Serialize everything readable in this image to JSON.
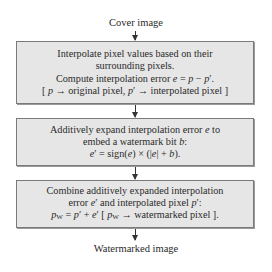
{
  "input_label": "Cover image",
  "output_label": "Watermarked image",
  "boxes": [
    {
      "lines": [
        "Interpolate pixel values based on their",
        "surrounding pixels.",
        "Compute interpolation error e = p − p′.",
        "[ p → original pixel, p′ → interpolated pixel ]"
      ]
    },
    {
      "lines": [
        "Additively expand interpolation error e to",
        "embed a watermark bit b:",
        "e′ = sign(e) × (|e| + b)."
      ]
    },
    {
      "lines": [
        "Combine additively expanded interpolation",
        "error e′ and interpolated pixel p′:",
        "pW = p′ + e′ [ pW → watermarked pixel ]."
      ]
    }
  ],
  "colors": {
    "box_fill": "#e6e6e6",
    "box_border": "#7a7a7a",
    "text": "#2a2a2a",
    "arrow": "#333333"
  }
}
